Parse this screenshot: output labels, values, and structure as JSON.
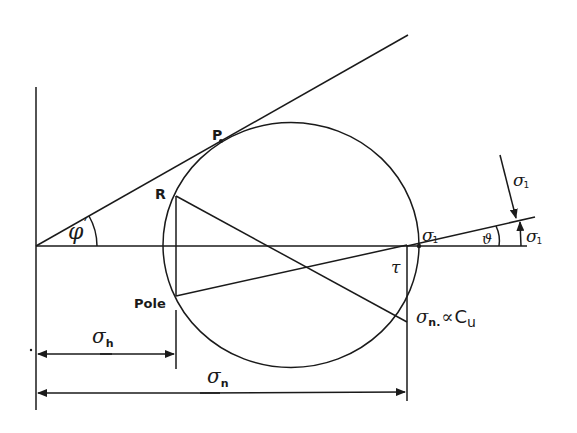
{
  "diagram": {
    "type": "Mohr circle construction",
    "stroke_color": "#1a1a1a",
    "background": "#ffffff",
    "labels": {
      "P": "P",
      "R": "R",
      "pole": "Pole",
      "phi": "φ",
      "phi_prime": "ʹ",
      "sigma": "σ",
      "sigma1_sub": "1",
      "theta": "ϑ",
      "tau": "τ",
      "sigma_n_sub": "n.",
      "sigma_n_suffix": "∝",
      "cu": "C",
      "cu_sub": "u",
      "sigma_h_sub": "h",
      "sigma_n_dim_sub": "n"
    },
    "dimensions": [
      {
        "name": "sigma_h",
        "from_x": 36,
        "to_x": 176
      },
      {
        "name": "sigma_n",
        "from_x": 36,
        "to_x": 407
      }
    ]
  }
}
